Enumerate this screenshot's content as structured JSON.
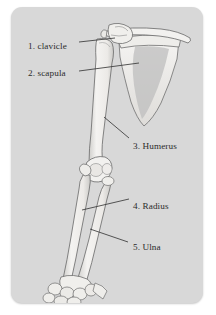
{
  "figure": {
    "card_background": "#d8d8d8",
    "page_background": "#ffffff",
    "label_color": "#2b2b2b",
    "bone_fill": "#f2f1ef",
    "bone_outline": "#6f6f6f",
    "shadow_fill": "#bdbdbd"
  },
  "labels": [
    {
      "id": "clavicle",
      "text": "1. clavicle",
      "number": "1",
      "name": "clavicle"
    },
    {
      "id": "scapula",
      "text": "2. scapula",
      "number": "2",
      "name": "scapula"
    },
    {
      "id": "humerus",
      "text": "3. Humerus",
      "number": "3",
      "name": "Humerus"
    },
    {
      "id": "radius",
      "text": "4. Radius",
      "number": "4",
      "name": "Radius"
    },
    {
      "id": "ulna",
      "text": "5. Ulna",
      "number": "5",
      "name": "Ulna"
    }
  ]
}
